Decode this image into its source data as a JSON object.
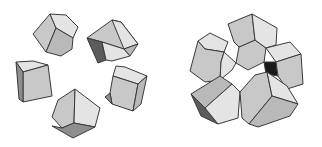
{
  "colors": {
    "background": "#ffffff",
    "stroke": "#3a3a3a",
    "light": "#e4e4e4",
    "mid": "#c8c8c8",
    "mid2": "#b9b9b9",
    "dark": "#8e8e8e",
    "darkest": "#5c5c5c",
    "black": "#1a1a1a"
  },
  "panels": [
    {
      "id": "scattered",
      "label": "five separated polyhedral blocks",
      "blocks": [
        {
          "name": "top-block",
          "faces": [
            {
              "pts": "33,34 50,14 56,28 46,52",
              "shade": "mid"
            },
            {
              "pts": "50,14 66,15 78,27 73,38 56,28",
              "shade": "light"
            },
            {
              "pts": "56,28 73,38 72,49 61,56 46,52",
              "shade": "mid2"
            }
          ]
        },
        {
          "name": "upper-right-block",
          "faces": [
            {
              "pts": "87,38 112,20 121,22 138,44 124,49 102,42",
              "shade": "mid"
            },
            {
              "pts": "112,20 121,22 138,44 124,49",
              "shade": "light"
            },
            {
              "pts": "87,38 102,42 106,60 98,63",
              "shade": "darkest"
            },
            {
              "pts": "102,42 124,49 130,56 112,61 106,60",
              "shade": "light"
            },
            {
              "pts": "124,49 138,44 130,56",
              "shade": "mid2"
            }
          ]
        },
        {
          "name": "left-block",
          "faces": [
            {
              "pts": "16,62 33,61 48,65 23,72",
              "shade": "light"
            },
            {
              "pts": "23,72 48,65 52,96 23,102",
              "shade": "mid"
            },
            {
              "pts": "16,62 23,72 23,102 19,99",
              "shade": "dark"
            }
          ]
        },
        {
          "name": "bottom-block",
          "faces": [
            {
              "pts": "52,117 58,100 75,89 74,123 62,128",
              "shade": "mid"
            },
            {
              "pts": "75,89 100,108 95,127 74,123",
              "shade": "light"
            },
            {
              "pts": "52,126 62,128 74,123 95,127 73,138",
              "shade": "dark"
            }
          ]
        },
        {
          "name": "right-block",
          "faces": [
            {
              "pts": "116,66 125,67 147,76 138,84 113,76",
              "shade": "light"
            },
            {
              "pts": "113,76 138,84 133,111 112,104 110,93",
              "shade": "mid"
            },
            {
              "pts": "138,84 147,76 141,104 133,111",
              "shade": "mid2"
            },
            {
              "pts": "105,97 110,93 112,104",
              "shade": "dark"
            }
          ]
        }
      ]
    },
    {
      "id": "assembled",
      "label": "five blocks assembled into a ring around a hexagonal core",
      "blocks": [
        {
          "name": "center-hexagon",
          "faces": [
            {
              "pts": "239,47 255,40 266,48 264,62 248,70 236,63",
              "shade": "mid"
            }
          ]
        },
        {
          "name": "ring-top",
          "faces": [
            {
              "pts": "228,24 252,14 255,40 239,47 234,42",
              "shade": "mid"
            },
            {
              "pts": "252,14 277,28 276,45 266,48 255,40",
              "shade": "light"
            }
          ]
        },
        {
          "name": "ring-left",
          "faces": [
            {
              "pts": "198,41 210,33 228,42 224,52 205,49",
              "shade": "light"
            },
            {
              "pts": "190,71 198,41 205,49 224,52 221,62 220,80 205,82",
              "shade": "mid"
            },
            {
              "pts": "221,62 224,52 236,63 232,70 220,80",
              "shade": "light"
            }
          ]
        },
        {
          "name": "ring-right",
          "faces": [
            {
              "pts": "266,48 290,42 301,54 276,62",
              "shade": "light"
            },
            {
              "pts": "264,62 276,62 278,76 266,74",
              "shade": "black"
            },
            {
              "pts": "276,62 301,54 303,84 287,89 278,76",
              "shade": "mid"
            }
          ]
        },
        {
          "name": "ring-bottom-left",
          "faces": [
            {
              "pts": "191,94 220,76 232,84 205,108",
              "shade": "mid2"
            },
            {
              "pts": "191,94 205,108 218,124 201,116",
              "shade": "darkest"
            },
            {
              "pts": "205,108 232,84 240,92 238,118 218,124",
              "shade": "light"
            }
          ]
        },
        {
          "name": "ring-bottom-right",
          "faces": [
            {
              "pts": "240,92 255,75 267,72 272,96 249,124 242,118",
              "shade": "mid"
            },
            {
              "pts": "267,72 287,86 298,104 272,96",
              "shade": "light"
            },
            {
              "pts": "249,124 272,96 298,104 290,116 258,127",
              "shade": "mid2"
            }
          ]
        }
      ]
    }
  ]
}
